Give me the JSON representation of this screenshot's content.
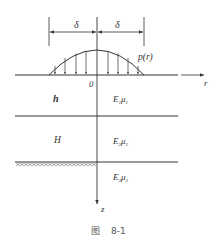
{
  "figure": {
    "caption_prefix": "图",
    "caption_number": "8-1",
    "colors": {
      "line": "#333333",
      "background": "#ffffff"
    }
  },
  "labels": {
    "delta_left": "δ",
    "delta_right": "δ",
    "load": "p(r)",
    "origin": "0",
    "r_axis": "r",
    "z_axis": "z",
    "layer1_thickness": "h",
    "layer2_thickness": "H",
    "layer1_props": {
      "E": "E",
      "E_sub": "1",
      "mu": "μ",
      "mu_sub": "1"
    },
    "layer2_props": {
      "E": "E",
      "E_sub": "2",
      "mu": "μ",
      "mu_sub": "2"
    },
    "layer3_props": {
      "E": "E",
      "E_sub": "3",
      "mu": "μ",
      "mu_sub": "3"
    }
  }
}
